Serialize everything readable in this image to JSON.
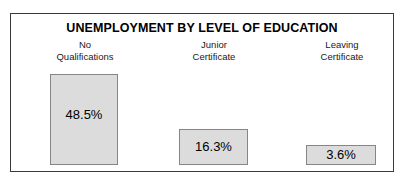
{
  "chart_data": {
    "type": "bar",
    "title": "UNEMPLOYMENT BY LEVEL OF EDUCATION",
    "xlabel": "",
    "ylabel": "",
    "grid": false,
    "legend": "none",
    "ylim": [
      0,
      48.5
    ],
    "categories": [
      "No Qualifications",
      "Junior Certificate",
      "Leaving Certificate"
    ],
    "values": [
      48.5,
      16.3,
      3.6
    ],
    "value_labels": [
      "48.5%",
      "16.3%",
      "3.6%"
    ],
    "category_lines": [
      [
        "No",
        "Qualifications"
      ],
      [
        "Junior",
        "Certificate"
      ],
      [
        "Leaving",
        "Certificate"
      ]
    ],
    "bar_fill_color": "#dcdcdc",
    "bar_border_color": "#868686",
    "frame_border_color": "#3a3a3a",
    "background_color": "#ffffff"
  }
}
